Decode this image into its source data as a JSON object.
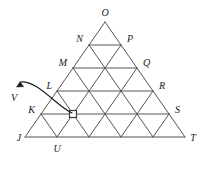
{
  "figure": {
    "kind": "triangular-lattice-diagram",
    "rows": 5,
    "stroke_color": "#555555",
    "label_color": "#1a1a1a",
    "background_color": "#ffffff",
    "apex": {
      "id": "O",
      "label": "O",
      "x": 105,
      "y": 22
    },
    "left_edge": [
      {
        "id": "N",
        "label": "N",
        "x": 89,
        "y": 45
      },
      {
        "id": "M",
        "label": "M",
        "x": 73,
        "y": 68
      },
      {
        "id": "L",
        "label": "L",
        "x": 57,
        "y": 91
      },
      {
        "id": "K",
        "label": "K",
        "x": 41,
        "y": 114
      },
      {
        "id": "J",
        "label": "J",
        "x": 25,
        "y": 137
      }
    ],
    "right_edge": [
      {
        "id": "P",
        "label": "P",
        "x": 121,
        "y": 45
      },
      {
        "id": "Q",
        "label": "Q",
        "x": 137,
        "y": 68
      },
      {
        "id": "R",
        "label": "R",
        "x": 153,
        "y": 91
      },
      {
        "id": "S",
        "label": "S",
        "x": 169,
        "y": 114
      },
      {
        "id": "T",
        "label": "T",
        "x": 185,
        "y": 137
      }
    ],
    "bottom_edge": [
      {
        "id": "U",
        "label": "U",
        "x": 57,
        "y": 137
      }
    ],
    "marked_point": {
      "id": "V",
      "label": "V",
      "marker": "open-square",
      "marker_x": 73,
      "marker_y": 114,
      "label_x": 14,
      "label_y": 99,
      "annotation": "curved-arrow"
    },
    "labels": {
      "O": "O",
      "N": "N",
      "P": "P",
      "M": "M",
      "Q": "Q",
      "L": "L",
      "R": "R",
      "K": "K",
      "S": "S",
      "J": "J",
      "U": "U",
      "T": "T",
      "V": "V"
    }
  }
}
